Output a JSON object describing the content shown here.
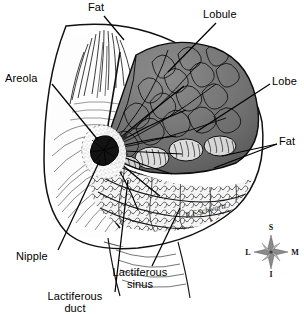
{
  "figure": {
    "background_color": "#ffffff",
    "ink_color": "#000000",
    "gland_fill": "#6f6f6f",
    "fat_fill": "#f2f2f2"
  },
  "labels": [
    {
      "id": "fat-top",
      "text": "Fat",
      "x": 88,
      "y": 2,
      "align": "left"
    },
    {
      "id": "lobule",
      "text": "Lobule",
      "x": 203,
      "y": 9,
      "align": "left"
    },
    {
      "id": "areola",
      "text": "Areola",
      "x": 5,
      "y": 73,
      "align": "left"
    },
    {
      "id": "lobe",
      "text": "Lobe",
      "x": 272,
      "y": 76,
      "align": "left"
    },
    {
      "id": "fat-right",
      "text": "Fat",
      "x": 279,
      "y": 136,
      "align": "left"
    },
    {
      "id": "nipple",
      "text": "Nipple",
      "x": 16,
      "y": 251,
      "align": "left"
    },
    {
      "id": "lactiferous-sinus",
      "text": "Lactiferous\nsinus",
      "x": 140,
      "y": 267,
      "align": "center"
    },
    {
      "id": "lactiferous-duct",
      "text": "Lactiferous\nduct",
      "x": 75,
      "y": 291,
      "align": "center"
    }
  ],
  "compass": {
    "name": "anatomical-orientation-compass",
    "cx": 271,
    "cy": 252,
    "points": [
      {
        "id": "superior",
        "letter": "S",
        "position": "top"
      },
      {
        "id": "medial",
        "letter": "M",
        "position": "right"
      },
      {
        "id": "inferior",
        "letter": "I",
        "position": "bottom"
      },
      {
        "id": "lateral",
        "letter": "L",
        "position": "left"
      }
    ]
  },
  "signature": {
    "text": "R.F.Schwartz",
    "x": 186,
    "y": 214
  }
}
